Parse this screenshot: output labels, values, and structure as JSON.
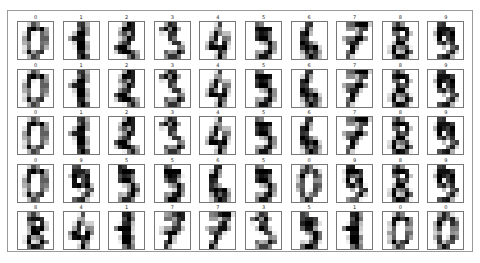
{
  "figure": {
    "rows": 5,
    "cols": 10,
    "labels": [
      [
        "0",
        "1",
        "2",
        "3",
        "4",
        "5",
        "6",
        "7",
        "8",
        "9"
      ],
      [
        "0",
        "1",
        "2",
        "3",
        "4",
        "5",
        "6",
        "7",
        "8",
        "9"
      ],
      [
        "0",
        "1",
        "2",
        "3",
        "4",
        "5",
        "6",
        "7",
        "8",
        "9"
      ],
      [
        "0",
        "9",
        "5",
        "5",
        "6",
        "5",
        "0",
        "9",
        "8",
        "9"
      ],
      [
        "8",
        "4",
        "1",
        "7",
        "7",
        "3",
        "5",
        "1",
        "0",
        "0"
      ]
    ],
    "colormap": "binary"
  },
  "glyphs": {
    "0": [
      [
        0,
        0,
        5,
        13,
        9,
        1,
        0,
        0
      ],
      [
        0,
        0,
        13,
        15,
        10,
        15,
        5,
        0
      ],
      [
        0,
        3,
        15,
        2,
        0,
        11,
        8,
        0
      ],
      [
        0,
        4,
        12,
        0,
        0,
        8,
        8,
        0
      ],
      [
        0,
        5,
        8,
        0,
        0,
        9,
        8,
        0
      ],
      [
        0,
        4,
        11,
        0,
        1,
        12,
        7,
        0
      ],
      [
        0,
        2,
        14,
        5,
        10,
        12,
        0,
        0
      ],
      [
        0,
        0,
        6,
        13,
        10,
        0,
        0,
        0
      ]
    ],
    "1": [
      [
        0,
        0,
        0,
        12,
        13,
        5,
        0,
        0
      ],
      [
        0,
        0,
        0,
        11,
        16,
        9,
        0,
        0
      ],
      [
        0,
        0,
        3,
        15,
        16,
        6,
        0,
        0
      ],
      [
        0,
        7,
        15,
        16,
        16,
        2,
        0,
        0
      ],
      [
        0,
        0,
        1,
        16,
        16,
        3,
        0,
        0
      ],
      [
        0,
        0,
        1,
        16,
        16,
        6,
        0,
        0
      ],
      [
        0,
        0,
        1,
        16,
        16,
        6,
        0,
        0
      ],
      [
        0,
        0,
        0,
        11,
        16,
        10,
        0,
        0
      ]
    ],
    "2": [
      [
        0,
        0,
        0,
        4,
        15,
        12,
        0,
        0
      ],
      [
        0,
        0,
        3,
        16,
        15,
        14,
        0,
        0
      ],
      [
        0,
        0,
        8,
        13,
        8,
        16,
        0,
        0
      ],
      [
        0,
        0,
        1,
        6,
        15,
        11,
        0,
        0
      ],
      [
        0,
        1,
        8,
        13,
        15,
        1,
        0,
        0
      ],
      [
        0,
        9,
        16,
        16,
        5,
        0,
        0,
        0
      ],
      [
        0,
        3,
        13,
        16,
        16,
        11,
        5,
        0
      ],
      [
        0,
        0,
        0,
        3,
        11,
        16,
        9,
        0
      ]
    ],
    "3": [
      [
        0,
        0,
        7,
        15,
        13,
        1,
        0,
        0
      ],
      [
        0,
        8,
        13,
        6,
        15,
        4,
        0,
        0
      ],
      [
        0,
        2,
        1,
        13,
        13,
        0,
        0,
        0
      ],
      [
        0,
        0,
        2,
        15,
        11,
        1,
        0,
        0
      ],
      [
        0,
        0,
        0,
        1,
        12,
        12,
        1,
        0
      ],
      [
        0,
        0,
        0,
        0,
        1,
        10,
        8,
        0
      ],
      [
        0,
        0,
        8,
        4,
        5,
        14,
        9,
        0
      ],
      [
        0,
        0,
        7,
        13,
        13,
        9,
        0,
        0
      ]
    ],
    "4": [
      [
        0,
        0,
        0,
        1,
        11,
        0,
        0,
        0
      ],
      [
        0,
        0,
        0,
        7,
        8,
        0,
        0,
        0
      ],
      [
        0,
        0,
        1,
        13,
        6,
        2,
        2,
        0
      ],
      [
        0,
        0,
        7,
        15,
        0,
        9,
        8,
        0
      ],
      [
        0,
        5,
        16,
        10,
        0,
        16,
        6,
        0
      ],
      [
        0,
        4,
        15,
        16,
        13,
        16,
        1,
        0
      ],
      [
        0,
        0,
        0,
        3,
        15,
        10,
        0,
        0
      ],
      [
        0,
        0,
        0,
        2,
        16,
        4,
        0,
        0
      ]
    ],
    "5": [
      [
        0,
        0,
        12,
        10,
        0,
        0,
        0,
        0
      ],
      [
        0,
        0,
        14,
        16,
        16,
        14,
        0,
        0
      ],
      [
        0,
        0,
        13,
        16,
        15,
        10,
        1,
        0
      ],
      [
        0,
        0,
        11,
        16,
        16,
        7,
        0,
        0
      ],
      [
        0,
        0,
        0,
        4,
        7,
        16,
        7,
        0
      ],
      [
        0,
        0,
        0,
        0,
        4,
        16,
        9,
        0
      ],
      [
        0,
        0,
        5,
        4,
        12,
        16,
        4,
        0
      ],
      [
        0,
        0,
        9,
        16,
        16,
        10,
        0,
        0
      ]
    ],
    "6": [
      [
        0,
        0,
        0,
        12,
        13,
        0,
        0,
        0
      ],
      [
        0,
        0,
        5,
        16,
        8,
        0,
        0,
        0
      ],
      [
        0,
        0,
        13,
        16,
        3,
        0,
        0,
        0
      ],
      [
        0,
        0,
        14,
        13,
        0,
        0,
        0,
        0
      ],
      [
        0,
        0,
        15,
        12,
        7,
        2,
        0,
        0
      ],
      [
        0,
        0,
        13,
        16,
        13,
        16,
        3,
        0
      ],
      [
        0,
        0,
        7,
        16,
        11,
        15,
        8,
        0
      ],
      [
        0,
        0,
        1,
        9,
        15,
        11,
        3,
        0
      ]
    ],
    "7": [
      [
        0,
        0,
        7,
        8,
        13,
        16,
        15,
        1
      ],
      [
        0,
        0,
        7,
        7,
        4,
        11,
        12,
        0
      ],
      [
        0,
        0,
        0,
        0,
        8,
        13,
        1,
        0
      ],
      [
        0,
        4,
        8,
        8,
        15,
        15,
        6,
        0
      ],
      [
        0,
        2,
        11,
        15,
        15,
        4,
        0,
        0
      ],
      [
        0,
        0,
        0,
        16,
        5,
        0,
        0,
        0
      ],
      [
        0,
        0,
        9,
        15,
        1,
        0,
        0,
        0
      ],
      [
        0,
        0,
        13,
        5,
        0,
        0,
        0,
        0
      ]
    ],
    "8": [
      [
        0,
        0,
        9,
        14,
        8,
        1,
        0,
        0
      ],
      [
        0,
        0,
        12,
        14,
        14,
        12,
        0,
        0
      ],
      [
        0,
        0,
        9,
        10,
        0,
        15,
        4,
        0
      ],
      [
        0,
        0,
        3,
        16,
        12,
        14,
        2,
        0
      ],
      [
        0,
        0,
        4,
        16,
        16,
        2,
        0,
        0
      ],
      [
        0,
        3,
        16,
        8,
        10,
        13,
        2,
        0
      ],
      [
        0,
        1,
        15,
        1,
        3,
        16,
        8,
        0
      ],
      [
        0,
        0,
        11,
        16,
        15,
        11,
        1,
        0
      ]
    ],
    "9": [
      [
        0,
        0,
        11,
        12,
        0,
        0,
        0,
        0
      ],
      [
        0,
        2,
        16,
        16,
        16,
        13,
        0,
        0
      ],
      [
        0,
        3,
        16,
        12,
        10,
        14,
        0,
        0
      ],
      [
        0,
        1,
        16,
        1,
        12,
        15,
        0,
        0
      ],
      [
        0,
        0,
        13,
        16,
        9,
        15,
        2,
        0
      ],
      [
        0,
        0,
        0,
        3,
        0,
        9,
        11,
        0
      ],
      [
        0,
        0,
        0,
        0,
        9,
        15,
        4,
        0
      ],
      [
        0,
        0,
        9,
        12,
        13,
        3,
        0,
        0
      ]
    ]
  }
}
